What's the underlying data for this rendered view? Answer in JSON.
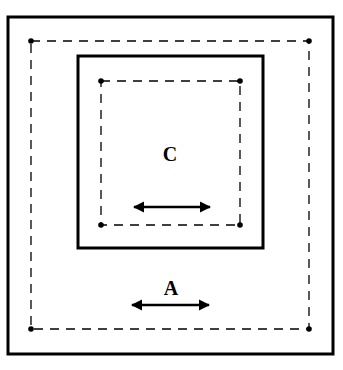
{
  "diagram": {
    "colors": {
      "stroke": "#000000",
      "background": "#ffffff"
    },
    "outer_box": {
      "x": 8,
      "y": 17,
      "w": 325,
      "h": 337
    },
    "outer_dashed": {
      "corners": [
        [
          31,
          41
        ],
        [
          309,
          41
        ],
        [
          309,
          329
        ],
        [
          31,
          329
        ]
      ]
    },
    "inner_box": {
      "x": 78,
      "y": 56,
      "w": 185,
      "h": 192
    },
    "inner_dashed": {
      "corners": [
        [
          101,
          81
        ],
        [
          240,
          81
        ],
        [
          240,
          225
        ],
        [
          101,
          225
        ]
      ]
    },
    "labels": {
      "inner": {
        "text": "C",
        "x": 170,
        "y": 161
      },
      "outer": {
        "text": "A",
        "x": 171,
        "y": 295
      }
    },
    "arrows": [
      {
        "name": "inner-arrow",
        "x1": 133,
        "x2": 211,
        "y": 207
      },
      {
        "name": "outer-arrow",
        "x1": 131,
        "x2": 210,
        "y": 305
      }
    ]
  }
}
